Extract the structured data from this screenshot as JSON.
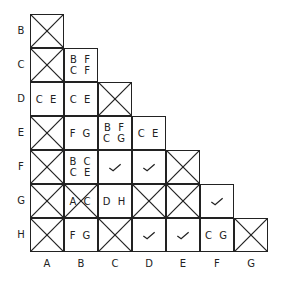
{
  "row_labels": [
    "B",
    "C",
    "D",
    "E",
    "F",
    "G",
    "H"
  ],
  "col_labels": [
    "A",
    "B",
    "C",
    "D",
    "E",
    "F",
    "G"
  ],
  "cells": {
    "B_A": {
      "type": "x",
      "text": ""
    },
    "C_A": {
      "type": "x",
      "text": ""
    },
    "C_B": {
      "type": "text",
      "line1": "B F",
      "line2": "C F"
    },
    "D_A": {
      "type": "text",
      "line1": "C E",
      "line2": ""
    },
    "D_B": {
      "type": "text",
      "line1": "C E",
      "line2": ""
    },
    "D_C": {
      "type": "x"
    },
    "E_A": {
      "type": "x"
    },
    "E_B": {
      "type": "text",
      "line1": "F G",
      "line2": ""
    },
    "E_C": {
      "type": "text",
      "line1": "B F",
      "line2": "C G"
    },
    "E_D": {
      "type": "text",
      "line1": "C E",
      "line2": ""
    },
    "F_A": {
      "type": "x"
    },
    "F_B": {
      "type": "text",
      "line1": "B C",
      "line2": "C E"
    },
    "F_C": {
      "type": "check",
      "line1": "✓"
    },
    "F_D": {
      "type": "check",
      "line1": "✓"
    },
    "F_E": {
      "type": "x"
    },
    "G_A": {
      "type": "x"
    },
    "G_B": {
      "type": "x-text",
      "line1": "A C"
    },
    "G_C": {
      "type": "text",
      "line1": "D H",
      "line2": ""
    },
    "G_D": {
      "type": "x"
    },
    "G_E": {
      "type": "x"
    },
    "G_F": {
      "type": "check",
      "line1": "✓"
    },
    "H_A": {
      "type": "x"
    },
    "H_B": {
      "type": "text",
      "line1": "F G",
      "line2": ""
    },
    "H_C": {
      "type": "x"
    },
    "H_D": {
      "type": "check",
      "line1": "✓"
    },
    "H_E": {
      "type": "check",
      "line1": "✓"
    },
    "H_F": {
      "type": "text",
      "line1": "C G",
      "line2": ""
    },
    "H_G": {
      "type": "x"
    }
  }
}
